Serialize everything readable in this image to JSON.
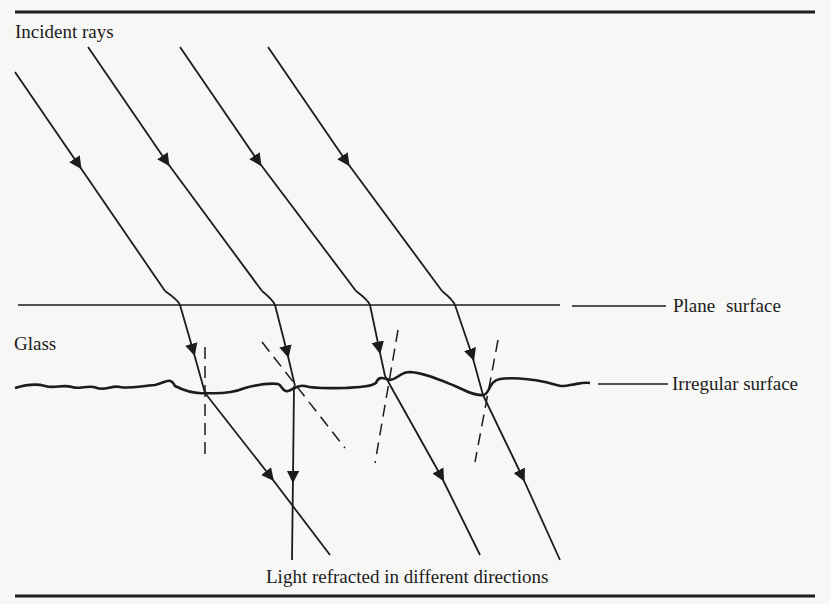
{
  "figure": {
    "labels": {
      "incident_rays": "Incident rays",
      "glass": "Glass",
      "plane_surface": "Plane surface",
      "irregular_surface": "Irregular surface",
      "refracted": "Light refracted in different directions"
    },
    "colors": {
      "ink": "#1c1c1c",
      "paper": "#f7f7f5",
      "bleed_through": "#e4e4e1"
    },
    "rays": [
      {
        "incident_start": [
          15,
          72
        ],
        "plane_hit": [
          180,
          305
        ],
        "irregular_hit": [
          205,
          393
        ],
        "exit_end": [
          330,
          555
        ],
        "normal": [
          [
            205,
            347
          ],
          [
            205,
            455
          ]
        ]
      },
      {
        "incident_start": [
          88,
          47
        ],
        "plane_hit": [
          275,
          305
        ],
        "irregular_hit": [
          295,
          386
        ],
        "exit_end": [
          292,
          560
        ],
        "normal": [
          [
            262,
            342
          ],
          [
            345,
            448
          ]
        ]
      },
      {
        "incident_start": [
          180,
          47
        ],
        "plane_hit": [
          370,
          305
        ],
        "irregular_hit": [
          385,
          376
        ],
        "exit_end": [
          480,
          555
        ],
        "normal": [
          [
            398,
            330
          ],
          [
            375,
            463
          ]
        ]
      },
      {
        "incident_start": [
          268,
          47
        ],
        "plane_hit": [
          455,
          305
        ],
        "irregular_hit": [
          483,
          395
        ],
        "exit_end": [
          560,
          560
        ],
        "normal": [
          [
            498,
            340
          ],
          [
            475,
            462
          ]
        ]
      }
    ]
  }
}
